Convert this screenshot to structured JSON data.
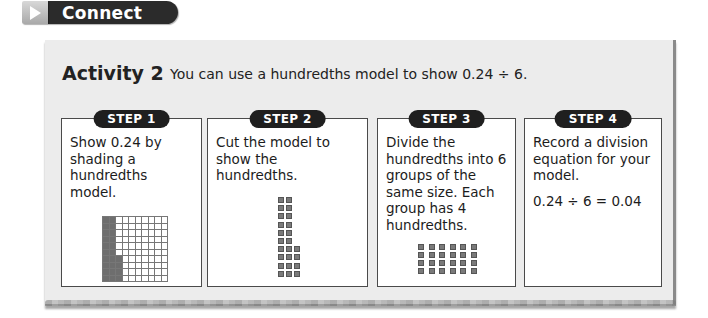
{
  "banner": {
    "icon": "play-triangle-icon",
    "label": "Connect"
  },
  "activity": {
    "title": "Activity 2",
    "description": "You can use a hundredths model to show 0.24 ÷ 6."
  },
  "steps": [
    {
      "badge": "STEP 1",
      "text": "Show 0.24 by shading a hundredths model.",
      "visual": {
        "type": "hundredths-grid",
        "rows": 10,
        "cols": 10,
        "shaded": 24,
        "shading": "first 2 columns fully shaded + bottom 4 cells of column 3"
      }
    },
    {
      "badge": "STEP 2",
      "text": "Cut the model to show the hundredths.",
      "visual": {
        "type": "cut-pieces",
        "columns": [
          10,
          10,
          4
        ],
        "total": 24
      }
    },
    {
      "badge": "STEP 3",
      "text": "Divide the hundredths into 6 groups of the same size. Each group has 4 hundredths.",
      "visual": {
        "type": "groups",
        "groups": 6,
        "per_group": 4
      }
    },
    {
      "badge": "STEP 4",
      "text": "Record a division equation for your model.",
      "equation": "0.24 ÷ 6 = 0.04"
    }
  ],
  "colors": {
    "panel_bg": "#ececec",
    "badge_bg": "#1f1f1f",
    "shade": "#6e6e6e",
    "banner_bg": "#2b2b2b"
  }
}
